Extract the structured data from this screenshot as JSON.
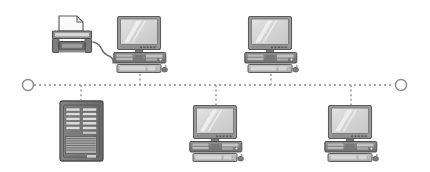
{
  "diagram": {
    "title": "Bus Topology Network Diagram",
    "type": "network-topology",
    "topology": "bus",
    "background_color": "#ffffff",
    "canvas": {
      "width": 430,
      "height": 172
    },
    "palette": {
      "outline_dark": "#595959",
      "body_gray": "#7a7a7a",
      "body_dark_gray": "#636363",
      "screen_light": "#d8d8d8",
      "screen_highlight": "#f0f0f0",
      "case_mid": "#8c8c8c",
      "case_light": "#bdbdbd",
      "bus_line": "#8a8a8a",
      "drop_line": "#9a9a9a"
    },
    "backbone": {
      "name": "network-bus-backbone",
      "style": "dotted",
      "y": 85,
      "x_start": 34,
      "x_end": 394,
      "color": "#8a8a8a",
      "dash": "2 3",
      "width": 1.6
    },
    "terminators": [
      {
        "name": "bus-terminator-left",
        "cx": 28,
        "cy": 85,
        "r": 5.5
      },
      {
        "name": "bus-terminator-right",
        "cx": 401,
        "cy": 85,
        "r": 5.5
      }
    ],
    "drop_lines": [
      {
        "name": "drop-line-workstation-1",
        "x": 140,
        "y_from": 74,
        "y_to": 85
      },
      {
        "name": "drop-line-workstation-2",
        "x": 271,
        "y_from": 74,
        "y_to": 85
      },
      {
        "name": "drop-line-server",
        "x": 81,
        "y_from": 85,
        "y_to": 100
      },
      {
        "name": "drop-line-workstation-3",
        "x": 216,
        "y_from": 85,
        "y_to": 105
      },
      {
        "name": "drop-line-workstation-4",
        "x": 351,
        "y_from": 85,
        "y_to": 105
      }
    ],
    "nodes": [
      {
        "name": "printer",
        "label": "Printer",
        "device_type": "printer",
        "x": 50,
        "y": 14,
        "width": 44,
        "height": 42
      },
      {
        "name": "workstation-1",
        "label": "Workstation",
        "device_type": "desktop-computer",
        "x": 113,
        "y": 16,
        "width": 58,
        "height": 58
      },
      {
        "name": "workstation-2",
        "label": "Workstation",
        "device_type": "desktop-computer",
        "x": 244,
        "y": 16,
        "width": 58,
        "height": 58
      },
      {
        "name": "server",
        "label": "Server",
        "device_type": "tower-server",
        "x": 59,
        "y": 100,
        "width": 45,
        "height": 62
      },
      {
        "name": "workstation-3",
        "label": "Workstation",
        "device_type": "desktop-computer",
        "x": 189,
        "y": 105,
        "width": 58,
        "height": 58
      },
      {
        "name": "workstation-4",
        "label": "Workstation",
        "device_type": "desktop-computer",
        "x": 324,
        "y": 105,
        "width": 58,
        "height": 58
      }
    ],
    "connections": [
      {
        "name": "printer-cable",
        "from": "printer",
        "to": "workstation-1",
        "style": "curved-solid"
      }
    ]
  }
}
